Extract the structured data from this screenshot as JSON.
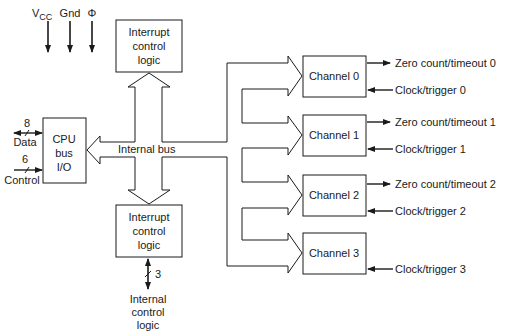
{
  "diagram": {
    "type": "block-diagram",
    "power_inputs": [
      {
        "label": "V",
        "subscript": "CC"
      },
      {
        "label": "Gnd"
      },
      {
        "label": "Φ"
      }
    ],
    "cpu_block": {
      "lines": [
        "CPU",
        "bus",
        "I/O"
      ],
      "data_label": "Data",
      "data_width": "8",
      "control_label": "Control",
      "control_width": "6"
    },
    "internal_bus_label": "Internal bus",
    "interrupt_top": {
      "lines": [
        "Interrupt",
        "control",
        "logic"
      ]
    },
    "interrupt_bottom": {
      "lines": [
        "Interrupt",
        "control",
        "logic"
      ],
      "bus_width": "3",
      "output_lines": [
        "Internal",
        "control",
        "logic"
      ]
    },
    "channels": [
      {
        "label": "Channel 0",
        "output": "Zero count/timeout 0",
        "input": "Clock/trigger 0"
      },
      {
        "label": "Channel 1",
        "output": "Zero count/timeout 1",
        "input": "Clock/trigger 1"
      },
      {
        "label": "Channel 2",
        "output": "Zero count/timeout 2",
        "input": "Clock/trigger 2"
      },
      {
        "label": "Channel 3",
        "input": "Clock/trigger 3"
      }
    ]
  }
}
